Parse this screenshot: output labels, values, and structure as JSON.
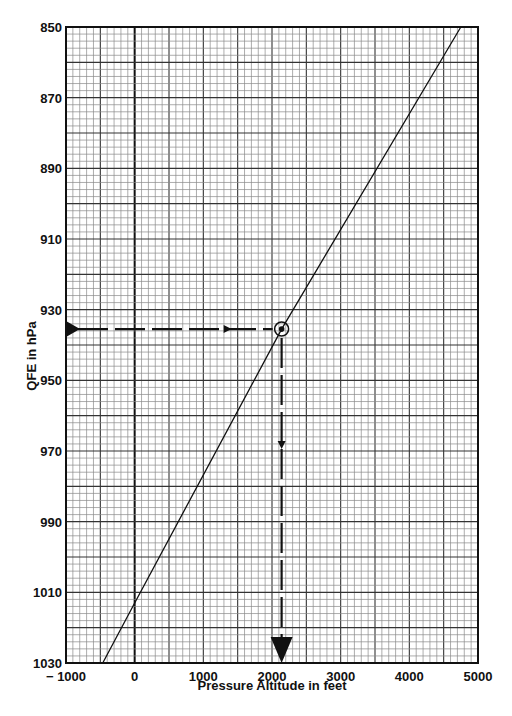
{
  "chart_data": {
    "type": "line",
    "title": "",
    "xlabel": "Pressure Altitude in feet",
    "ylabel": "QFE in hPa",
    "xlim": [
      -1000,
      5000
    ],
    "ylim": [
      850,
      1030
    ],
    "y_inverted": true,
    "x_ticks": [
      -1000,
      0,
      1000,
      2000,
      3000,
      4000,
      5000
    ],
    "x_tick_labels": [
      "− 1000",
      "0",
      "1000",
      "2000",
      "3000",
      "4000",
      "5000"
    ],
    "y_ticks": [
      850,
      870,
      890,
      910,
      930,
      950,
      970,
      990,
      1010,
      1030
    ],
    "y_tick_labels": [
      "850",
      "870",
      "890",
      "910",
      "930",
      "950",
      "970",
      "990",
      "1010",
      "1030"
    ],
    "grid": true,
    "grid_minor_x": 100,
    "grid_minor_y": 2,
    "grid_major_x": 500,
    "grid_major_y": 10,
    "series": [
      {
        "name": "QFE to pressure altitude",
        "x": [
          -465,
          0,
          2140,
          4750
        ],
        "y": [
          1030,
          1013,
          935.5,
          850
        ]
      }
    ],
    "annotations": [
      {
        "type": "dashed-arrow",
        "from": [
          -1000,
          935.5
        ],
        "to": [
          2140,
          935.5
        ],
        "label": "entry QFE ~935 hPa"
      },
      {
        "type": "circle-marker",
        "at": [
          2140,
          935.5
        ]
      },
      {
        "type": "dashed-arrow",
        "from": [
          2140,
          935.5
        ],
        "to": [
          2140,
          1030
        ],
        "label": "read pressure altitude ~2140 ft"
      }
    ]
  },
  "colors": {
    "ink": "#111111",
    "grid_minor": "#8a8a8a",
    "grid_major": "#333333",
    "background": "#ffffff"
  }
}
